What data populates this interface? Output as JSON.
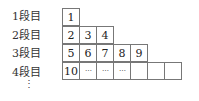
{
  "rows": [
    {
      "label": "1段目",
      "cells": [
        "1"
      ]
    },
    {
      "label": "2段目",
      "cells": [
        "2",
        "3",
        "4"
      ]
    },
    {
      "label": "3段目",
      "cells": [
        "5",
        "6",
        "7",
        "8",
        "9"
      ]
    },
    {
      "label": "4段目",
      "cells": [
        "10",
        "⋯",
        "⋯",
        "⋯",
        "",
        "",
        ""
      ]
    }
  ],
  "continuation": "⋮"
}
